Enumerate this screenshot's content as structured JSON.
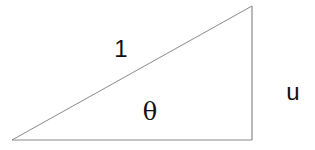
{
  "diagram": {
    "type": "right-triangle",
    "vertices": {
      "left": [
        12,
        140
      ],
      "top_right": [
        252,
        6
      ],
      "bottom_right": [
        252,
        140
      ]
    },
    "stroke_color": "#8a8a8a",
    "labels": {
      "hypotenuse": "1",
      "angle": "θ",
      "opposite_side": "u"
    }
  }
}
